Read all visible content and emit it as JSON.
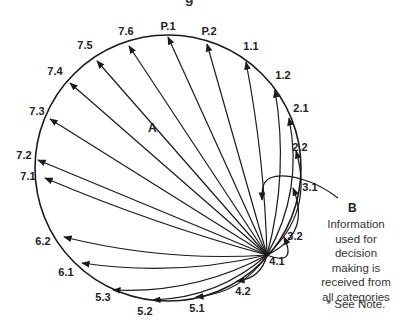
{
  "title_fragment": "g",
  "center_label": "A",
  "callout": {
    "letter": "B",
    "lines": [
      "Information",
      "used for",
      "decision",
      "making is",
      "received from",
      "all categories"
    ]
  },
  "footnote": "* See Note.",
  "hub": {
    "label": "4.1",
    "x": 267,
    "y": 255
  },
  "circle": {
    "cx": 168,
    "cy": 168,
    "r": 133,
    "stroke": "#1a1a1a"
  },
  "nodes": [
    {
      "id": "P.1",
      "lx": 168,
      "ly": 30,
      "tx": 168,
      "ty": 37,
      "bend": 0
    },
    {
      "id": "P.2",
      "lx": 209,
      "ly": 35,
      "tx": 207,
      "ty": 44,
      "bend": 0
    },
    {
      "id": "1.1",
      "lx": 251,
      "ly": 50,
      "tx": 246,
      "ty": 62,
      "bend": 8
    },
    {
      "id": "1.2",
      "lx": 283,
      "ly": 79,
      "tx": 275,
      "ty": 90,
      "bend": 18
    },
    {
      "id": "2.1",
      "lx": 301,
      "ly": 112,
      "tx": 289,
      "ty": 118,
      "bend": 26
    },
    {
      "id": "2.2",
      "lx": 300,
      "ly": 151,
      "tx": 296,
      "ty": 151,
      "bend": 34
    },
    {
      "id": "3.1",
      "lx": 310,
      "ly": 191,
      "tx": 293,
      "ty": 188,
      "bend": 34
    },
    {
      "id": "3.2",
      "lx": 295,
      "ly": 240,
      "tx": 284,
      "ty": 237,
      "bend": 30
    },
    {
      "id": "4.2",
      "lx": 243,
      "ly": 295,
      "tx": 237,
      "ty": 281,
      "bend": -14
    },
    {
      "id": "5.1",
      "lx": 197,
      "ly": 312,
      "tx": 196,
      "ty": 297,
      "bend": -20
    },
    {
      "id": "5.2",
      "lx": 145,
      "ly": 315,
      "tx": 153,
      "ty": 300,
      "bend": -22
    },
    {
      "id": "5.3",
      "lx": 103,
      "ly": 301,
      "tx": 113,
      "ty": 290,
      "bend": -22
    },
    {
      "id": "6.1",
      "lx": 66,
      "ly": 276,
      "tx": 82,
      "ty": 263,
      "bend": -18
    },
    {
      "id": "6.2",
      "lx": 43,
      "ly": 245,
      "tx": 64,
      "ty": 237,
      "bend": -16
    },
    {
      "id": "7.1",
      "lx": 28,
      "ly": 180,
      "tx": 45,
      "ty": 178,
      "bend": -8
    },
    {
      "id": "7.2",
      "lx": 24,
      "ly": 159,
      "tx": 38,
      "ty": 160,
      "bend": 0
    },
    {
      "id": "7.3",
      "lx": 37,
      "ly": 115,
      "tx": 50,
      "ty": 119,
      "bend": 0
    },
    {
      "id": "7.4",
      "lx": 55,
      "ly": 75,
      "tx": 70,
      "ty": 83,
      "bend": 0
    },
    {
      "id": "7.5",
      "lx": 85,
      "ly": 49,
      "tx": 97,
      "ty": 61,
      "bend": 0
    },
    {
      "id": "7.6",
      "lx": 126,
      "ly": 35,
      "tx": 129,
      "ty": 46,
      "bend": 0
    }
  ]
}
